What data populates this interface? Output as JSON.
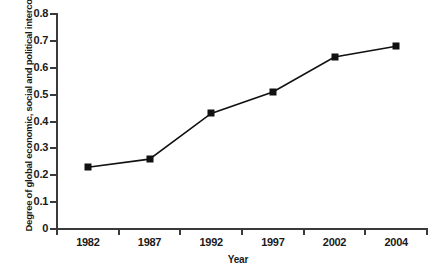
{
  "chart_data": {
    "type": "line",
    "title": "",
    "xlabel": "Year",
    "ylabel": "Degree of global economic, social and political interconnectedness",
    "categories": [
      "1982",
      "1987",
      "1992",
      "1997",
      "2002",
      "2004"
    ],
    "values": [
      0.23,
      0.26,
      0.43,
      0.51,
      0.64,
      0.68
    ],
    "series": [
      {
        "name": "Degree of global economic, social and political interconnectedness",
        "values": [
          0.23,
          0.26,
          0.43,
          0.51,
          0.64,
          0.68
        ]
      }
    ],
    "ylim": [
      0,
      0.8
    ],
    "ytick_labels": [
      "0",
      "0.1",
      "0.2",
      "0.3",
      "0.4",
      "0.5",
      "0.6",
      "0.7",
      "0.8"
    ],
    "ytick_values": [
      0,
      0.1,
      0.2,
      0.3,
      0.4,
      0.5,
      0.6,
      0.7,
      0.8
    ],
    "grid": false,
    "legend": false,
    "legend_position": "none",
    "marker": "square",
    "line_color": "#111111",
    "marker_color": "#111111",
    "axis_color": "#3a3a3a",
    "background_color": "#ffffff"
  }
}
